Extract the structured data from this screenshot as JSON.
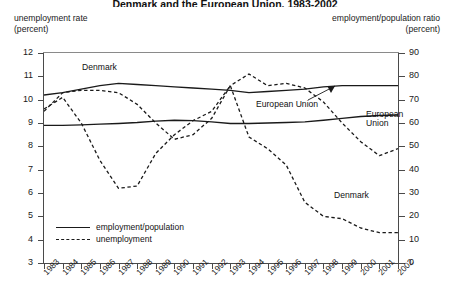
{
  "title": "Denmark and the European Union, 1983-2002",
  "axes": {
    "left_label_line1": "unemployment rate",
    "left_label_line2": "(percent)",
    "right_label_line1": "employment/population ratio",
    "right_label_line2": "(percent)"
  },
  "legend": {
    "items": [
      {
        "key": "solid",
        "label": "employment/population"
      },
      {
        "key": "dashed",
        "label": "unemployment"
      }
    ]
  },
  "annotations": [
    {
      "name": "denmark-employment-label",
      "text": "Denmark",
      "x": 82,
      "y": 63
    },
    {
      "name": "european-union-employment-label",
      "text": "European Union",
      "x": 256,
      "y": 100
    },
    {
      "name": "european-union-unemployment-label-line1",
      "text": "European",
      "x": 366,
      "y": 110
    },
    {
      "name": "european-union-unemployment-label-line2",
      "text": "Union",
      "x": 366,
      "y": 119
    },
    {
      "name": "denmark-unemployment-label",
      "text": "Denmark",
      "x": 334,
      "y": 191
    }
  ],
  "colors": {
    "line": "#1a1a1a",
    "axis": "#4a4a4a",
    "background": "#ffffff"
  },
  "chart_data": {
    "type": "line",
    "title": "Denmark and the European Union, 1983-2002",
    "xlabel": "",
    "ylabel": "unemployment rate (percent)",
    "y2label": "employment/population ratio (percent)",
    "ylim": [
      3,
      12
    ],
    "y2lim": [
      0,
      90
    ],
    "yticks": [
      3,
      4,
      5,
      6,
      7,
      8,
      9,
      10,
      11,
      12
    ],
    "y2ticks": [
      0,
      10,
      20,
      30,
      40,
      50,
      60,
      70,
      80,
      90
    ],
    "grid": false,
    "legend_position": "lower-left",
    "x": [
      1983,
      1984,
      1985,
      1986,
      1987,
      1988,
      1989,
      1990,
      1991,
      1992,
      1993,
      1994,
      1995,
      1996,
      1997,
      1998,
      1999,
      2000,
      2001,
      2002
    ],
    "xticklabels": [
      "1983",
      "1984",
      "1985",
      "1986",
      "1987",
      "1988",
      "1989",
      "1990",
      "1991",
      "1992",
      "1993",
      "1994",
      "1995",
      "1996",
      "1997",
      "1998",
      "1999",
      "2000",
      "2001",
      "2002"
    ],
    "series": [
      {
        "name": "Denmark employment/population",
        "axis": "right",
        "style": "solid",
        "units": "percent",
        "values": [
          72.0,
          73.0,
          74.5,
          76.0,
          77.0,
          76.5,
          76.0,
          75.5,
          75.0,
          74.5,
          74.0,
          73.0,
          73.5,
          74.0,
          74.5,
          75.5,
          76.0,
          76.0,
          76.0,
          76.0
        ]
      },
      {
        "name": "European Union employment/population",
        "axis": "right",
        "style": "solid",
        "units": "percent",
        "values": [
          59.0,
          59.0,
          59.2,
          59.5,
          59.8,
          60.2,
          60.8,
          61.2,
          61.0,
          60.5,
          59.8,
          59.8,
          60.0,
          60.2,
          60.5,
          61.2,
          62.0,
          62.8,
          63.2,
          63.4
        ]
      },
      {
        "name": "Denmark unemployment",
        "axis": "left",
        "style": "dashed",
        "units": "percent",
        "values": [
          9.6,
          10.1,
          9.0,
          7.4,
          6.2,
          6.3,
          7.7,
          8.5,
          9.1,
          9.5,
          10.6,
          8.4,
          7.9,
          7.2,
          5.6,
          5.0,
          4.9,
          4.5,
          4.3,
          4.3
        ]
      },
      {
        "name": "European Union unemployment",
        "axis": "left",
        "style": "dashed",
        "units": "percent",
        "values": [
          9.5,
          10.3,
          10.4,
          10.4,
          10.3,
          9.8,
          9.0,
          8.3,
          8.5,
          9.2,
          10.6,
          11.1,
          10.6,
          10.7,
          10.5,
          9.9,
          9.0,
          8.2,
          7.6,
          7.9
        ]
      }
    ]
  }
}
